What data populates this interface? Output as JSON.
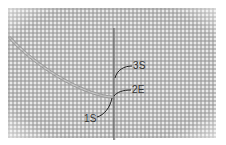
{
  "image": {
    "description": "Needlepoint canvas with a needle inserted vertically and thread coming from upper left; stitch points labeled",
    "labels": [
      {
        "id": "1S",
        "text": "1S"
      },
      {
        "id": "2E",
        "text": "2E"
      },
      {
        "id": "3S",
        "text": "3S"
      }
    ],
    "colors": {
      "canvas": "#e9e9e9",
      "grid": "#969696",
      "thread": "#9a9a9a",
      "needle": "#6e6e6e",
      "leader": "#222222"
    }
  }
}
